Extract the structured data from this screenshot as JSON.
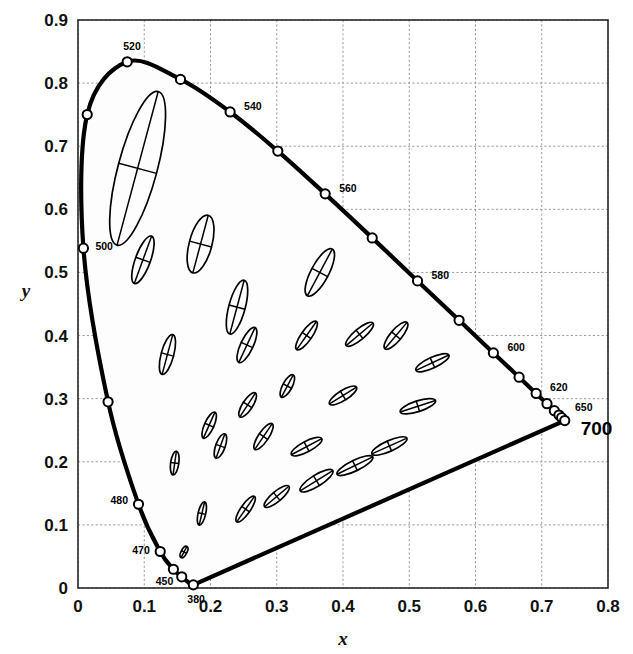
{
  "figure": {
    "kind": "cie-1931-chromaticity-diagram-with-macadam-ellipses",
    "background_color": "#ffffff",
    "locus_color": "#000000",
    "grid_color": "#9a9a9a",
    "ellipse_color": "#000000"
  },
  "chart_data": {
    "type": "scatter",
    "title": "",
    "xlabel": "x",
    "ylabel": "y",
    "xlim": [
      0,
      0.8
    ],
    "ylim": [
      0,
      0.9
    ],
    "grid": true,
    "legend": "none",
    "xticks": [
      "0",
      "0.1",
      "0.2",
      "0.3",
      "0.4",
      "0.5",
      "0.6",
      "0.7",
      "0.8"
    ],
    "xtick_values": [
      0,
      0.1,
      0.2,
      0.3,
      0.4,
      0.5,
      0.6,
      0.7,
      0.8
    ],
    "yticks": [
      "0",
      "0.1",
      "0.2",
      "0.3",
      "0.4",
      "0.5",
      "0.6",
      "0.7",
      "0.8",
      "0.9"
    ],
    "ytick_values": [
      0,
      0.1,
      0.2,
      0.3,
      0.4,
      0.5,
      0.6,
      0.7,
      0.8,
      0.9
    ],
    "spectral_locus": [
      {
        "wl": 380,
        "x": 0.1741,
        "y": 0.005
      },
      {
        "wl": 390,
        "x": 0.1738,
        "y": 0.0049
      },
      {
        "wl": 400,
        "x": 0.1733,
        "y": 0.0048
      },
      {
        "wl": 410,
        "x": 0.1726,
        "y": 0.0048
      },
      {
        "wl": 420,
        "x": 0.1714,
        "y": 0.0051
      },
      {
        "wl": 430,
        "x": 0.1689,
        "y": 0.0069
      },
      {
        "wl": 440,
        "x": 0.1644,
        "y": 0.0109
      },
      {
        "wl": 450,
        "x": 0.1566,
        "y": 0.0177
      },
      {
        "wl": 460,
        "x": 0.144,
        "y": 0.0297
      },
      {
        "wl": 470,
        "x": 0.1241,
        "y": 0.0578
      },
      {
        "wl": 480,
        "x": 0.0913,
        "y": 0.1327
      },
      {
        "wl": 490,
        "x": 0.0454,
        "y": 0.295
      },
      {
        "wl": 500,
        "x": 0.0082,
        "y": 0.5384
      },
      {
        "wl": 510,
        "x": 0.0139,
        "y": 0.7502
      },
      {
        "wl": 520,
        "x": 0.0743,
        "y": 0.8338
      },
      {
        "wl": 530,
        "x": 0.1547,
        "y": 0.8059
      },
      {
        "wl": 540,
        "x": 0.2296,
        "y": 0.7543
      },
      {
        "wl": 550,
        "x": 0.3016,
        "y": 0.6923
      },
      {
        "wl": 560,
        "x": 0.3731,
        "y": 0.6245
      },
      {
        "wl": 570,
        "x": 0.4441,
        "y": 0.5547
      },
      {
        "wl": 580,
        "x": 0.5125,
        "y": 0.4866
      },
      {
        "wl": 590,
        "x": 0.5752,
        "y": 0.4242
      },
      {
        "wl": 600,
        "x": 0.627,
        "y": 0.3725
      },
      {
        "wl": 610,
        "x": 0.6658,
        "y": 0.334
      },
      {
        "wl": 620,
        "x": 0.6915,
        "y": 0.3083
      },
      {
        "wl": 630,
        "x": 0.7079,
        "y": 0.292
      },
      {
        "wl": 640,
        "x": 0.719,
        "y": 0.2809
      },
      {
        "wl": 650,
        "x": 0.726,
        "y": 0.274
      },
      {
        "wl": 660,
        "x": 0.73,
        "y": 0.27
      },
      {
        "wl": 680,
        "x": 0.7334,
        "y": 0.2666
      },
      {
        "wl": 700,
        "x": 0.7347,
        "y": 0.2653
      }
    ],
    "wavelength_markers": [
      380,
      450,
      460,
      470,
      480,
      490,
      500,
      510,
      520,
      530,
      540,
      550,
      560,
      570,
      580,
      590,
      600,
      610,
      620,
      630,
      640,
      650,
      660,
      700
    ],
    "wavelength_labels": [
      {
        "text": "520",
        "wl": 520,
        "dx": -4,
        "dy": -12
      },
      {
        "text": "540",
        "wl": 540,
        "dx": 14,
        "dy": -2
      },
      {
        "text": "560",
        "wl": 560,
        "dx": 14,
        "dy": -2
      },
      {
        "text": "580",
        "wl": 580,
        "dx": 14,
        "dy": -2
      },
      {
        "text": "600",
        "wl": 600,
        "dx": 14,
        "dy": -2
      },
      {
        "text": "620",
        "wl": 620,
        "dx": 14,
        "dy": -2
      },
      {
        "text": "650",
        "wl": 650,
        "dx": 16,
        "dy": -4
      },
      {
        "text": "700",
        "wl": 700,
        "dx": 16,
        "dy": 14
      },
      {
        "text": "500",
        "wl": 500,
        "dx": 12,
        "dy": 2
      },
      {
        "text": "480",
        "wl": 480,
        "dx": -28,
        "dy": 0
      },
      {
        "text": "470",
        "wl": 470,
        "dx": -28,
        "dy": 2
      },
      {
        "text": "450",
        "wl": 450,
        "dx": -26,
        "dy": 8
      },
      {
        "text": "380",
        "wl": 380,
        "dx": -6,
        "dy": 18
      }
    ],
    "macadam_ellipses": [
      {
        "id": 1,
        "cx": 0.16,
        "cy": 0.057,
        "a": 0.0095,
        "b": 0.0045,
        "angle": 62
      },
      {
        "id": 2,
        "cx": 0.187,
        "cy": 0.118,
        "a": 0.018,
        "b": 0.006,
        "angle": 77
      },
      {
        "id": 3,
        "cx": 0.253,
        "cy": 0.125,
        "a": 0.0235,
        "b": 0.0075,
        "angle": 55
      },
      {
        "id": 4,
        "cx": 0.15,
        "cy": 0.68,
        "a": 0.0,
        "b": 0.0,
        "angle": 0,
        "skip": true
      },
      {
        "id": 5,
        "cx": 0.3,
        "cy": 0.145,
        "a": 0.024,
        "b": 0.008,
        "angle": 40
      },
      {
        "id": 6,
        "cx": 0.36,
        "cy": 0.17,
        "a": 0.029,
        "b": 0.009,
        "angle": 32
      },
      {
        "id": 7,
        "cx": 0.146,
        "cy": 0.198,
        "a": 0.018,
        "b": 0.0065,
        "angle": 82
      },
      {
        "id": 8,
        "cx": 0.215,
        "cy": 0.225,
        "a": 0.0195,
        "b": 0.0075,
        "angle": 70
      },
      {
        "id": 9,
        "cx": 0.28,
        "cy": 0.24,
        "a": 0.0235,
        "b": 0.008,
        "angle": 56
      },
      {
        "id": 10,
        "cx": 0.345,
        "cy": 0.224,
        "a": 0.026,
        "b": 0.0085,
        "angle": 28
      },
      {
        "id": 11,
        "cx": 0.418,
        "cy": 0.194,
        "a": 0.03,
        "b": 0.0085,
        "angle": 26
      },
      {
        "id": 12,
        "cx": 0.47,
        "cy": 0.225,
        "a": 0.029,
        "b": 0.0085,
        "angle": 24
      },
      {
        "id": 13,
        "cx": 0.198,
        "cy": 0.258,
        "a": 0.0215,
        "b": 0.0075,
        "angle": 66
      },
      {
        "id": 14,
        "cx": 0.256,
        "cy": 0.29,
        "a": 0.0215,
        "b": 0.008,
        "angle": 57
      },
      {
        "id": 15,
        "cx": 0.316,
        "cy": 0.32,
        "a": 0.019,
        "b": 0.0075,
        "angle": 62
      },
      {
        "id": 16,
        "cx": 0.4,
        "cy": 0.305,
        "a": 0.024,
        "b": 0.008,
        "angle": 32
      },
      {
        "id": 17,
        "cx": 0.513,
        "cy": 0.288,
        "a": 0.028,
        "b": 0.0085,
        "angle": 18
      },
      {
        "id": 18,
        "cx": 0.135,
        "cy": 0.37,
        "a": 0.031,
        "b": 0.01,
        "angle": 75
      },
      {
        "id": 19,
        "cx": 0.255,
        "cy": 0.385,
        "a": 0.029,
        "b": 0.01,
        "angle": 65
      },
      {
        "id": 20,
        "cx": 0.345,
        "cy": 0.4,
        "a": 0.026,
        "b": 0.0085,
        "angle": 55
      },
      {
        "id": 21,
        "cx": 0.425,
        "cy": 0.402,
        "a": 0.0265,
        "b": 0.0085,
        "angle": 40
      },
      {
        "id": 22,
        "cx": 0.48,
        "cy": 0.4,
        "a": 0.026,
        "b": 0.009,
        "angle": 50
      },
      {
        "id": 23,
        "cx": 0.535,
        "cy": 0.357,
        "a": 0.0275,
        "b": 0.0085,
        "angle": 25
      },
      {
        "id": 24,
        "cx": 0.24,
        "cy": 0.445,
        "a": 0.042,
        "b": 0.013,
        "angle": 75
      },
      {
        "id": 25,
        "cx": 0.365,
        "cy": 0.5,
        "a": 0.04,
        "b": 0.014,
        "angle": 62
      },
      {
        "id": 26,
        "cx": 0.098,
        "cy": 0.52,
        "a": 0.038,
        "b": 0.012,
        "angle": 70
      },
      {
        "id": 27,
        "cx": 0.185,
        "cy": 0.545,
        "a": 0.045,
        "b": 0.018,
        "angle": 75
      },
      {
        "id": 28,
        "cx": 0.09,
        "cy": 0.665,
        "a": 0.12,
        "b": 0.031,
        "angle": 75
      }
    ]
  },
  "labels": {
    "x_axis_title": "x",
    "y_axis_title": "y"
  }
}
